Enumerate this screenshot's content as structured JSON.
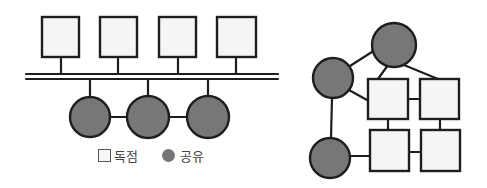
{
  "diagram": {
    "colors": {
      "stroke": "#1e1e1e",
      "exclusive_fill": "#f5f5f5",
      "shared_fill": "#777777"
    },
    "left": {
      "description": "bus topology",
      "exclusive_nodes": 4,
      "shared_nodes": 3
    },
    "right": {
      "description": "mesh topology",
      "exclusive_nodes": 4,
      "shared_nodes": 3
    },
    "legend": [
      {
        "shape": "square",
        "label": "독점"
      },
      {
        "shape": "circle",
        "label": "공유"
      }
    ]
  }
}
